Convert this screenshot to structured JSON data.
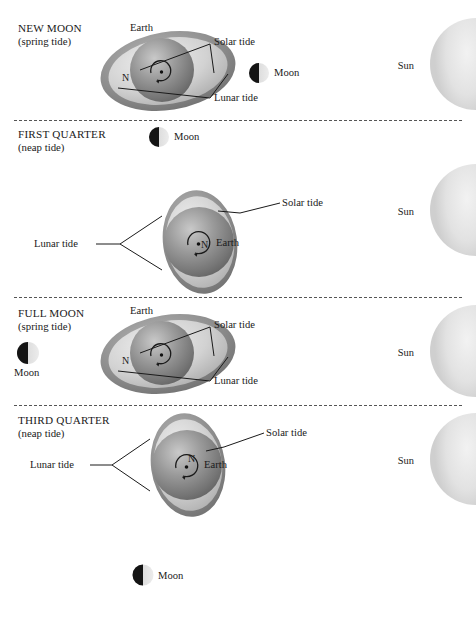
{
  "figure": {
    "background": "#ffffff",
    "colors": {
      "earth_dark": "#6f6f6f",
      "earth_mid": "#8d8d8d",
      "earth_light": "#b9b9b9",
      "bulge": "#d8d8d8",
      "sun": "#e4e4e4",
      "moon_dark": "#141414",
      "moon_light": "#dcdcdc",
      "line": "#1a1a1a",
      "divider": "#555555"
    }
  },
  "panels": [
    {
      "id": "new-moon",
      "title": "NEW MOON",
      "subtitle": "(spring tide)",
      "earth_label": "Earth",
      "solar_label": "Solar tide",
      "lunar_label": "Lunar tide",
      "pole_label": "N",
      "moon_label": "Moon",
      "sun_label": "Sun",
      "tide_type": "spring",
      "moon_phase": "new"
    },
    {
      "id": "first-quarter",
      "title": "FIRST QUARTER",
      "subtitle": "(neap tide)",
      "earth_label": "Earth",
      "solar_label": "Solar tide",
      "lunar_label": "Lunar tide",
      "pole_label": "N",
      "moon_label": "Moon",
      "sun_label": "Sun",
      "tide_type": "neap",
      "moon_phase": "first-quarter"
    },
    {
      "id": "full-moon",
      "title": "FULL MOON",
      "subtitle": "(spring tide)",
      "earth_label": "Earth",
      "solar_label": "Solar tide",
      "lunar_label": "Lunar tide",
      "pole_label": "N",
      "moon_label": "Moon",
      "sun_label": "Sun",
      "tide_type": "spring",
      "moon_phase": "full"
    },
    {
      "id": "third-quarter",
      "title": "THIRD QUARTER",
      "subtitle": "(neap tide)",
      "earth_label": "Earth",
      "solar_label": "Solar tide",
      "lunar_label": "Lunar tide",
      "pole_label": "N",
      "moon_label": "Moon",
      "sun_label": "Sun",
      "tide_type": "neap",
      "moon_phase": "third-quarter"
    }
  ],
  "footer": {
    "moon_label": "Moon"
  }
}
